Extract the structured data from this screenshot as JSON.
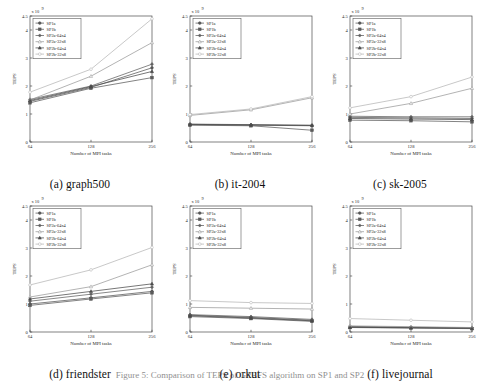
{
  "figure": {
    "caption_partial": "Figure 5: Comparison of TEPS of GPBFS algorithm on SP1 and SP2",
    "rows": 2,
    "cols": 3
  },
  "legend": {
    "entries": [
      {
        "label": "SP1a",
        "color": "#555555",
        "marker": "circle-filled"
      },
      {
        "label": "SP1b",
        "color": "#5a5a5a",
        "marker": "square-filled"
      },
      {
        "label": "SP2a-64x4",
        "color": "#606060",
        "marker": "diamond-filled"
      },
      {
        "label": "SP2a-32x8",
        "color": "#9a9a9a",
        "marker": "triangle-open"
      },
      {
        "label": "SP2b-64x4",
        "color": "#4a4a4a",
        "marker": "triangle-filled"
      },
      {
        "label": "SP2b-32x8",
        "color": "#b5b5b5",
        "marker": "circle-open"
      }
    ],
    "position": "upper-left"
  },
  "axes": {
    "xlabel": "Number of MPI tasks",
    "ylabel": "TEPS",
    "xticks": [
      "64",
      "128",
      "256"
    ],
    "yticks": [
      "0",
      "1",
      "2",
      "3",
      "4",
      "4.5"
    ],
    "ytick_values": [
      0,
      1,
      2,
      3,
      4,
      4.5
    ],
    "ylim": [
      0,
      4.5
    ],
    "exponent": "x 10",
    "exponent_power": "9"
  },
  "chart_data": [
    {
      "type": "line",
      "panel": "a",
      "title": "(a) graph500",
      "xlabel": "Number of MPI tasks",
      "ylabel": "TEPS",
      "x": [
        64,
        128,
        256
      ],
      "xtick_labels": [
        "64",
        "128",
        "256"
      ],
      "ylim": [
        0,
        4.5
      ],
      "yscale_multiplier": "1e9",
      "grid": false,
      "series": [
        {
          "name": "SP1a",
          "values": [
            1.45,
            1.95,
            2.65
          ]
        },
        {
          "name": "SP1b",
          "values": [
            1.4,
            1.92,
            2.3
          ]
        },
        {
          "name": "SP2a-64x4",
          "values": [
            1.52,
            2.0,
            2.78
          ]
        },
        {
          "name": "SP2a-32x8",
          "values": [
            1.5,
            2.35,
            3.55
          ]
        },
        {
          "name": "SP2b-64x4",
          "values": [
            1.48,
            1.98,
            2.52
          ]
        },
        {
          "name": "SP2b-32x8",
          "values": [
            1.78,
            2.6,
            4.4
          ]
        }
      ]
    },
    {
      "type": "line",
      "panel": "b",
      "title": "(b) it-2004",
      "xlabel": "Number of MPI tasks",
      "ylabel": "TEPS",
      "x": [
        64,
        128,
        256
      ],
      "xtick_labels": [
        "64",
        "128",
        "256"
      ],
      "ylim": [
        0,
        4.5
      ],
      "yscale_multiplier": "1e9",
      "grid": false,
      "series": [
        {
          "name": "SP1a",
          "values": [
            0.62,
            0.6,
            0.58
          ]
        },
        {
          "name": "SP1b",
          "values": [
            0.6,
            0.58,
            0.42
          ]
        },
        {
          "name": "SP2a-64x4",
          "values": [
            0.64,
            0.62,
            0.6
          ]
        },
        {
          "name": "SP2a-32x8",
          "values": [
            0.95,
            1.15,
            1.58
          ]
        },
        {
          "name": "SP2b-64x4",
          "values": [
            0.63,
            0.61,
            0.59
          ]
        },
        {
          "name": "SP2b-32x8",
          "values": [
            0.98,
            1.18,
            1.62
          ]
        }
      ]
    },
    {
      "type": "line",
      "panel": "c",
      "title": "(c) sk-2005",
      "xlabel": "Number of MPI tasks",
      "ylabel": "TEPS",
      "x": [
        64,
        128,
        256
      ],
      "xtick_labels": [
        "64",
        "128",
        "256"
      ],
      "ylim": [
        0,
        4.5
      ],
      "yscale_multiplier": "1e9",
      "grid": false,
      "series": [
        {
          "name": "SP1a",
          "values": [
            0.88,
            0.86,
            0.84
          ]
        },
        {
          "name": "SP1b",
          "values": [
            0.78,
            0.76,
            0.72
          ]
        },
        {
          "name": "SP2a-64x4",
          "values": [
            0.92,
            0.9,
            0.9
          ]
        },
        {
          "name": "SP2a-32x8",
          "values": [
            1.0,
            1.38,
            1.92
          ]
        },
        {
          "name": "SP2b-64x4",
          "values": [
            0.84,
            0.82,
            0.8
          ]
        },
        {
          "name": "SP2b-32x8",
          "values": [
            1.22,
            1.62,
            2.32
          ]
        }
      ]
    },
    {
      "type": "line",
      "panel": "d",
      "title": "(d) friendster",
      "xlabel": "Number of MPI tasks",
      "ylabel": "TEPS",
      "x": [
        64,
        128,
        256
      ],
      "xtick_labels": [
        "64",
        "128",
        "256"
      ],
      "ylim": [
        0,
        4.5
      ],
      "yscale_multiplier": "1e9",
      "grid": false,
      "series": [
        {
          "name": "SP1a",
          "values": [
            1.0,
            1.22,
            1.45
          ]
        },
        {
          "name": "SP1b",
          "values": [
            0.95,
            1.18,
            1.4
          ]
        },
        {
          "name": "SP2a-64x4",
          "values": [
            1.1,
            1.35,
            1.6
          ]
        },
        {
          "name": "SP2a-32x8",
          "values": [
            1.25,
            1.62,
            2.4
          ]
        },
        {
          "name": "SP2b-64x4",
          "values": [
            1.18,
            1.45,
            1.72
          ]
        },
        {
          "name": "SP2b-32x8",
          "values": [
            1.68,
            2.22,
            3.02
          ]
        }
      ]
    },
    {
      "type": "line",
      "panel": "e",
      "title": "(e) orkut",
      "xlabel": "Number of MPI tasks",
      "ylabel": "TEPS",
      "x": [
        64,
        128,
        256
      ],
      "xtick_labels": [
        "64",
        "128",
        "256"
      ],
      "ylim": [
        0,
        4.5
      ],
      "yscale_multiplier": "1e9",
      "grid": false,
      "series": [
        {
          "name": "SP1a",
          "values": [
            0.6,
            0.52,
            0.42
          ]
        },
        {
          "name": "SP1b",
          "values": [
            0.55,
            0.48,
            0.38
          ]
        },
        {
          "name": "SP2a-64x4",
          "values": [
            0.62,
            0.55,
            0.45
          ]
        },
        {
          "name": "SP2a-32x8",
          "values": [
            0.88,
            0.85,
            0.82
          ]
        },
        {
          "name": "SP2b-64x4",
          "values": [
            0.58,
            0.5,
            0.4
          ]
        },
        {
          "name": "SP2b-32x8",
          "values": [
            1.12,
            1.05,
            1.02
          ]
        }
      ]
    },
    {
      "type": "line",
      "panel": "f",
      "title": "(f) livejournal",
      "xlabel": "Number of MPI tasks",
      "ylabel": "TEPS",
      "x": [
        64,
        128,
        256
      ],
      "xtick_labels": [
        "64",
        "128",
        "256"
      ],
      "ylim": [
        0,
        4.5
      ],
      "yscale_multiplier": "1e9",
      "grid": false,
      "series": [
        {
          "name": "SP1a",
          "values": [
            0.18,
            0.16,
            0.14
          ]
        },
        {
          "name": "SP1b",
          "values": [
            0.16,
            0.14,
            0.12
          ]
        },
        {
          "name": "SP2a-64x4",
          "values": [
            0.2,
            0.17,
            0.15
          ]
        },
        {
          "name": "SP2a-32x8",
          "values": [
            0.22,
            0.19,
            0.16
          ]
        },
        {
          "name": "SP2b-64x4",
          "values": [
            0.17,
            0.15,
            0.13
          ]
        },
        {
          "name": "SP2b-32x8",
          "values": [
            0.48,
            0.42,
            0.36
          ]
        }
      ]
    }
  ]
}
